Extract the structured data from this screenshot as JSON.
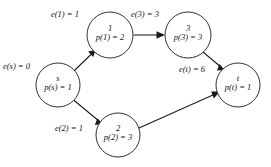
{
  "diagram": {
    "type": "directed-graph",
    "background_color": "#ffffff",
    "stroke_color": "#1a1a1a",
    "nodes": [
      {
        "id": "s",
        "id_label": "s",
        "internal_label": "p(s) = 1",
        "external_label": "e(s) = 0",
        "e_value": 0,
        "p_value": 1,
        "cx": 58,
        "cy": 85,
        "r": 22
      },
      {
        "id": "1",
        "id_label": "1",
        "internal_label": "p(1) = 2",
        "external_label": "e(1) = 1",
        "e_value": 1,
        "p_value": 2,
        "cx": 110,
        "cy": 35,
        "r": 23
      },
      {
        "id": "2",
        "id_label": "2",
        "internal_label": "p(2) = 3",
        "external_label": "e(2) = 1",
        "e_value": 1,
        "p_value": 3,
        "cx": 118,
        "cy": 135,
        "r": 22
      },
      {
        "id": "3",
        "id_label": "3",
        "internal_label": "p(3) = 3",
        "external_label": "e(3) = 3",
        "e_value": 3,
        "p_value": 3,
        "cx": 188,
        "cy": 35,
        "r": 23
      },
      {
        "id": "t",
        "id_label": "t",
        "internal_label": "p(t) = 1",
        "external_label": "e(t) = 6",
        "e_value": 6,
        "p_value": 1,
        "cx": 238,
        "cy": 85,
        "r": 22
      }
    ],
    "edges": [
      {
        "from": "s",
        "to": "1"
      },
      {
        "from": "s",
        "to": "2"
      },
      {
        "from": "1",
        "to": "3"
      },
      {
        "from": "3",
        "to": "t"
      },
      {
        "from": "2",
        "to": "t"
      }
    ]
  }
}
